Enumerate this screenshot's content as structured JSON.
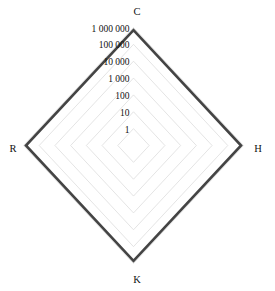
{
  "chart_data": {
    "type": "radar",
    "title": "",
    "subtitle": "",
    "xlabel": "",
    "ylabel": "",
    "scale": "log",
    "grid": true,
    "legend_position": "none",
    "categories": [
      "C",
      "H",
      "K",
      "R"
    ],
    "tick_labels": [
      "1",
      "10",
      "100",
      "1 000",
      "10 000",
      "100 000",
      "1 000 000"
    ],
    "tick_values": [
      1,
      10,
      100,
      1000,
      10000,
      100000,
      1000000
    ],
    "rlim": [
      1,
      1000000
    ],
    "series": [
      {
        "name": "",
        "values": [
          700000,
          700000,
          700000,
          700000
        ],
        "color": "#444444"
      }
    ],
    "colors": {
      "data_line": "#444444",
      "grid_line": "#d9d9d9",
      "label_text": "#111111",
      "background": "#ffffff"
    },
    "axis_labels": {
      "top": "C",
      "right": "H",
      "bottom": "K",
      "left": "R"
    }
  }
}
